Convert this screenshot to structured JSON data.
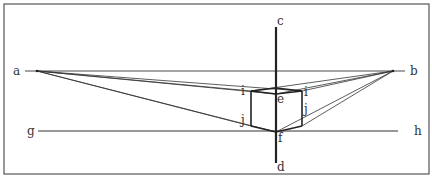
{
  "diagram": {
    "labels": {
      "a": "a",
      "b": "b",
      "c": "c",
      "d": "d",
      "e": "e",
      "f": "f",
      "g": "g",
      "h": "h",
      "i_left": "i",
      "i_right": "i",
      "j_left": "j",
      "j_right": "j"
    },
    "colors": {
      "line": "#333333",
      "frame": "#555555",
      "background": "#ffffff"
    }
  }
}
